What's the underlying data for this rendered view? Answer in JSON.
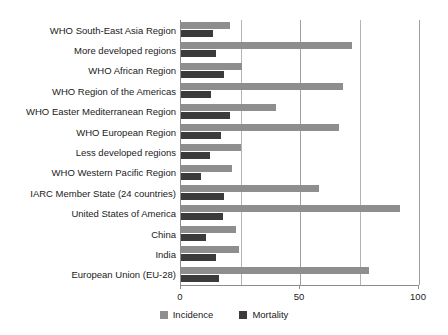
{
  "chart_data": {
    "type": "bar",
    "orientation": "horizontal",
    "title": "",
    "subtitle": "",
    "xlabel": "",
    "ylabel": "",
    "xlim": [
      0,
      100
    ],
    "xticks": [
      0,
      50,
      100
    ],
    "xtick_labels": [
      "0",
      "50",
      "100"
    ],
    "gridlines": [
      25,
      50,
      75,
      100
    ],
    "grid": true,
    "legend_position": "bottom-center",
    "categories": [
      "WHO South-East Asia Region",
      "More developed regions",
      "WHO African Region",
      "WHO Region of the Americas",
      "WHO Easter Mediterranean Region",
      "WHO European Region",
      "Less developed regions",
      "WHO Western Pacific Region",
      "IARC Member State (24 countries)",
      "United States of America",
      "China",
      "India",
      "European Union (EU-28)"
    ],
    "series": [
      {
        "name": "Incidence",
        "color": "#8e8e8e",
        "values": [
          20.5,
          72.0,
          25.5,
          68.0,
          40.0,
          66.5,
          25.0,
          21.5,
          58.0,
          92.0,
          23.0,
          24.5,
          79.0
        ]
      },
      {
        "name": "Mortality",
        "color": "#3b3b3b",
        "values": [
          13.5,
          14.5,
          18.0,
          12.5,
          20.5,
          17.0,
          12.0,
          8.5,
          18.0,
          17.5,
          10.5,
          14.5,
          16.0
        ]
      }
    ]
  },
  "legend": {
    "items": [
      {
        "label": "Incidence",
        "color": "#8e8e8e"
      },
      {
        "label": "Mortality",
        "color": "#3b3b3b"
      }
    ]
  }
}
